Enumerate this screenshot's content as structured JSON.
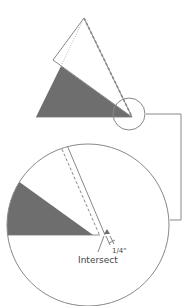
{
  "diagram": {
    "labels": {
      "intersect": "Intersect",
      "dimension": "1/4\""
    },
    "colors": {
      "wedge_fill": "#6e6e6e",
      "line": "#888888",
      "background": "#ffffff"
    },
    "parts": [
      "overview-wedge",
      "white-triangle-overlay",
      "detail-circle",
      "magnified-view",
      "connector-leader"
    ]
  }
}
